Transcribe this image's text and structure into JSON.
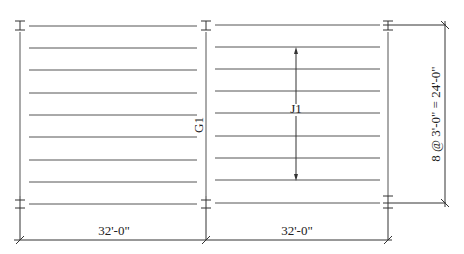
{
  "drawing": {
    "type": "framing-plan",
    "labels": {
      "girder": "G1",
      "joist": "J1"
    },
    "dimensions": {
      "bay_left": "32'-0\"",
      "bay_right": "32'-0\"",
      "joist_spacing": "8 @ 3'-0\" = 24'-0\""
    },
    "geometry": {
      "column_lines_x": [
        20,
        206,
        388
      ],
      "top_y": 25,
      "bottom_y": 203,
      "joist_count_spaces": 8,
      "bottom_dim_y": 240,
      "right_dim_x": 445,
      "j1_arrow_x": 296,
      "j1_arrow_top": 48,
      "j1_arrow_bottom": 180
    },
    "colors": {
      "line": "#555555",
      "text": "#222222",
      "background": "#ffffff"
    }
  }
}
